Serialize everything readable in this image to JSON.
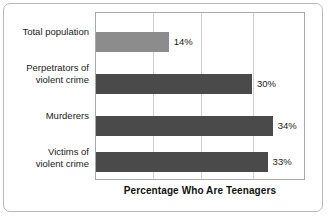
{
  "chart_data": {
    "type": "bar",
    "orientation": "horizontal",
    "title": "",
    "xlabel": "Percentage Who Are Teenagers",
    "ylabel": "",
    "xlim": [
      0,
      40
    ],
    "grid": true,
    "gridlines_at": [
      10,
      20,
      30,
      40
    ],
    "legend": "none",
    "categories": [
      "Total population",
      "Perpetrators of violent crime",
      "Murderers",
      "Victims of violent crime"
    ],
    "values": [
      14,
      30,
      34,
      33
    ],
    "value_labels": [
      "14%",
      "30%",
      "34%",
      "33%"
    ],
    "bar_colors": [
      "#8c8c8c",
      "#4a4a4a",
      "#4a4a4a",
      "#4a4a4a"
    ],
    "bars": [
      {
        "category": "Total population",
        "label_lines": [
          "Total population"
        ],
        "value": 14,
        "value_label": "14%",
        "color": "#8c8c8c"
      },
      {
        "category": "Perpetrators of violent crime",
        "label_lines": [
          "Perpetrators of",
          "violent crime"
        ],
        "value": 30,
        "value_label": "30%",
        "color": "#4a4a4a"
      },
      {
        "category": "Murderers",
        "label_lines": [
          "Murderers"
        ],
        "value": 34,
        "value_label": "34%",
        "color": "#4a4a4a"
      },
      {
        "category": "Victims of violent crime",
        "label_lines": [
          "Victims of",
          "violent crime"
        ],
        "value": 33,
        "value_label": "33%",
        "color": "#4a4a4a"
      }
    ]
  },
  "colors": {
    "bar_light": "#8c8c8c",
    "bar_dark": "#4a4a4a",
    "gridline": "#cfcfcf",
    "plot_border": "#a8a8a8",
    "frame_border": "#b9b9b9",
    "text": "#1a1a1a",
    "background": "#ffffff"
  }
}
